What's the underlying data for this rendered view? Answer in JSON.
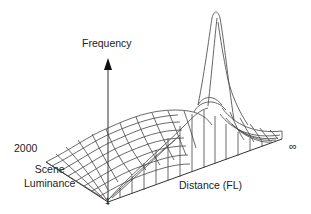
{
  "figure": {
    "type": "3d-surface-plot",
    "labels": {
      "z_axis": "Frequency",
      "y_axis": "Scene\nLuminance",
      "y_axis_line1": "Scene",
      "y_axis_line2": "Luminance",
      "x_axis": "Distance (FL)",
      "y_max_tick": "2000",
      "origin_tick": "1",
      "x_max_tick": "∞"
    },
    "colors": {
      "line": "#444444",
      "background": "#ffffff",
      "text": "#222222"
    }
  }
}
